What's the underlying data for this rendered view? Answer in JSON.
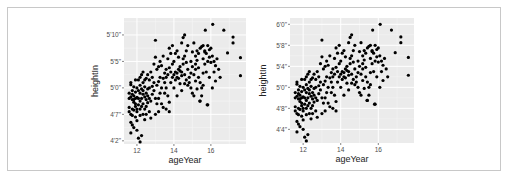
{
  "chart_data": [
    {
      "type": "scatter",
      "title": "",
      "xlabel": "ageYear",
      "ylabel": "heightIn",
      "xlim": [
        11.3,
        17.9
      ],
      "ylim": [
        49.4,
        73.2
      ],
      "x_ticks": [
        12,
        14,
        16
      ],
      "x_tick_labels": [
        "12",
        "14",
        "16"
      ],
      "y_ticks": [
        50,
        55,
        60,
        65,
        70
      ],
      "y_tick_labels": [
        "4'2\"",
        "4'7\"",
        "5'0\"",
        "5'5\"",
        "5'10\""
      ],
      "grid": true,
      "legend": "none",
      "panel_bg": "#ebebeb",
      "point_color": "#000000"
    },
    {
      "type": "scatter",
      "title": "",
      "xlabel": "ageYear",
      "ylabel": "heightIn",
      "xlim": [
        11.3,
        17.9
      ],
      "ylim": [
        49.4,
        73.2
      ],
      "x_ticks": [
        12,
        14,
        16
      ],
      "x_tick_labels": [
        "12",
        "14",
        "16"
      ],
      "y_ticks": [
        52,
        56,
        60,
        64,
        68,
        72
      ],
      "y_tick_labels": [
        "4'4\"",
        "4'8\"",
        "5'0\"",
        "5'4\"",
        "5'8\"",
        "6'0\""
      ],
      "grid": true,
      "legend": "none",
      "panel_bg": "#ebebeb",
      "point_color": "#000000"
    }
  ],
  "points": [
    [
      11.58,
      56.3
    ],
    [
      11.67,
      51.5
    ],
    [
      11.75,
      53.0
    ],
    [
      11.83,
      57.3
    ],
    [
      11.58,
      59.0
    ],
    [
      11.67,
      60.6
    ],
    [
      11.75,
      56.0
    ],
    [
      11.92,
      61.5
    ],
    [
      12.0,
      52.0
    ],
    [
      11.67,
      55.0
    ],
    [
      11.58,
      58.0
    ],
    [
      11.75,
      57.8
    ],
    [
      11.83,
      58.5
    ],
    [
      11.92,
      56.5
    ],
    [
      12.0,
      55.5
    ],
    [
      11.67,
      61.0
    ],
    [
      11.75,
      59.5
    ],
    [
      11.83,
      55.8
    ],
    [
      11.92,
      57.0
    ],
    [
      12.0,
      58.2
    ],
    [
      12.08,
      56.8
    ],
    [
      12.17,
      57.5
    ],
    [
      12.25,
      58.0
    ],
    [
      12.08,
      50.5
    ],
    [
      12.17,
      49.8
    ],
    [
      12.25,
      51.0
    ],
    [
      12.33,
      55.0
    ],
    [
      12.42,
      56.0
    ],
    [
      12.08,
      61.5
    ],
    [
      12.17,
      60.5
    ],
    [
      12.25,
      59.8
    ],
    [
      12.33,
      61.0
    ],
    [
      12.42,
      60.2
    ],
    [
      12.5,
      59.0
    ],
    [
      12.58,
      58.5
    ],
    [
      12.67,
      60.0
    ],
    [
      12.0,
      60.0
    ],
    [
      11.92,
      59.2
    ],
    [
      11.83,
      60.2
    ],
    [
      11.75,
      58.8
    ],
    [
      12.5,
      61.8
    ],
    [
      12.58,
      62.5
    ],
    [
      12.67,
      61.5
    ],
    [
      12.75,
      63.0
    ],
    [
      12.83,
      62.0
    ],
    [
      12.92,
      64.5
    ],
    [
      12.33,
      57.0
    ],
    [
      12.42,
      54.0
    ],
    [
      12.5,
      56.5
    ],
    [
      12.58,
      57.2
    ],
    [
      12.67,
      55.5
    ],
    [
      12.75,
      57.5
    ],
    [
      12.83,
      58.8
    ],
    [
      12.92,
      59.5
    ],
    [
      13.0,
      58.0
    ],
    [
      13.08,
      60.5
    ],
    [
      13.17,
      61.2
    ],
    [
      13.25,
      62.0
    ],
    [
      13.0,
      69.0
    ],
    [
      13.0,
      65.8
    ],
    [
      13.08,
      63.5
    ],
    [
      13.17,
      64.0
    ],
    [
      13.25,
      65.0
    ],
    [
      13.33,
      64.2
    ],
    [
      13.42,
      66.0
    ],
    [
      13.5,
      62.8
    ],
    [
      13.58,
      63.5
    ],
    [
      13.67,
      65.5
    ],
    [
      13.75,
      67.5
    ],
    [
      13.83,
      66.5
    ],
    [
      13.92,
      68.0
    ],
    [
      13.0,
      55.0
    ],
    [
      13.17,
      58.0
    ],
    [
      13.33,
      57.0
    ],
    [
      13.42,
      56.3
    ],
    [
      13.5,
      59.0
    ],
    [
      13.58,
      60.0
    ],
    [
      13.67,
      58.5
    ],
    [
      13.75,
      55.5
    ],
    [
      13.83,
      61.0
    ],
    [
      13.92,
      62.0
    ],
    [
      14.0,
      62.5
    ],
    [
      14.08,
      63.0
    ],
    [
      14.17,
      62.0
    ],
    [
      14.25,
      63.5
    ],
    [
      14.33,
      64.0
    ],
    [
      14.42,
      63.0
    ],
    [
      14.5,
      64.5
    ],
    [
      14.58,
      62.5
    ],
    [
      14.0,
      60.0
    ],
    [
      14.08,
      61.5
    ],
    [
      14.17,
      62.8
    ],
    [
      14.25,
      61.8
    ],
    [
      14.33,
      63.2
    ],
    [
      14.42,
      62.3
    ],
    [
      14.5,
      65.5
    ],
    [
      14.58,
      66.0
    ],
    [
      14.67,
      64.8
    ],
    [
      14.75,
      63.5
    ],
    [
      14.83,
      62.0
    ],
    [
      14.5,
      69.5
    ],
    [
      14.58,
      70.0
    ],
    [
      14.42,
      68.5
    ],
    [
      14.67,
      67.0
    ],
    [
      14.75,
      68.0
    ],
    [
      14.92,
      65.0
    ],
    [
      15.0,
      64.0
    ],
    [
      15.08,
      62.5
    ],
    [
      15.17,
      63.5
    ],
    [
      15.0,
      59.0
    ],
    [
      15.08,
      58.5
    ],
    [
      15.25,
      59.8
    ],
    [
      15.33,
      62.0
    ],
    [
      15.42,
      61.0
    ],
    [
      15.5,
      60.0
    ],
    [
      15.42,
      57.5
    ],
    [
      15.5,
      58.5
    ],
    [
      15.58,
      60.5
    ],
    [
      15.17,
      66.0
    ],
    [
      15.25,
      67.0
    ],
    [
      15.33,
      66.5
    ],
    [
      15.42,
      67.5
    ],
    [
      15.5,
      67.8
    ],
    [
      15.58,
      68.0
    ],
    [
      15.67,
      67.0
    ],
    [
      15.75,
      66.5
    ],
    [
      15.83,
      68.0
    ],
    [
      15.92,
      67.2
    ],
    [
      15.67,
      64.5
    ],
    [
      15.75,
      63.0
    ],
    [
      15.83,
      56.8
    ],
    [
      15.92,
      62.0
    ],
    [
      16.0,
      64.8
    ],
    [
      16.08,
      66.0
    ],
    [
      16.17,
      65.0
    ],
    [
      16.25,
      64.2
    ],
    [
      16.33,
      65.5
    ],
    [
      16.42,
      63.5
    ],
    [
      16.08,
      60.0
    ],
    [
      16.1,
      72.0
    ],
    [
      15.7,
      70.9
    ],
    [
      16.7,
      70.9
    ],
    [
      17.2,
      69.6
    ],
    [
      17.2,
      68.5
    ],
    [
      16.9,
      66.6
    ],
    [
      17.6,
      65.7
    ],
    [
      17.6,
      62.3
    ],
    [
      16.5,
      62.0
    ],
    [
      15.4,
      57.5
    ],
    [
      15.8,
      56.8
    ],
    [
      12.17,
      62.0
    ],
    [
      12.25,
      62.5
    ],
    [
      12.33,
      63.0
    ],
    [
      12.42,
      61.5
    ],
    [
      12.08,
      58.0
    ],
    [
      12.17,
      59.0
    ],
    [
      12.25,
      56.5
    ],
    [
      12.33,
      58.8
    ],
    [
      11.92,
      54.5
    ],
    [
      12.0,
      56.0
    ],
    [
      11.67,
      58.3
    ],
    [
      11.75,
      54.8
    ],
    [
      11.83,
      57.8
    ],
    [
      11.58,
      55.5
    ],
    [
      11.67,
      53.5
    ],
    [
      11.83,
      52.5
    ],
    [
      12.0,
      53.8
    ],
    [
      12.17,
      54.8
    ],
    [
      12.5,
      55.0
    ],
    [
      12.75,
      54.3
    ],
    [
      13.25,
      59.0
    ],
    [
      13.33,
      60.0
    ],
    [
      13.42,
      61.8
    ],
    [
      13.5,
      61.0
    ],
    [
      13.58,
      62.0
    ],
    [
      13.67,
      62.5
    ],
    [
      13.75,
      63.8
    ],
    [
      13.83,
      63.0
    ],
    [
      13.92,
      64.5
    ],
    [
      14.0,
      65.0
    ],
    [
      14.08,
      66.5
    ],
    [
      14.17,
      67.0
    ],
    [
      14.25,
      65.8
    ],
    [
      14.33,
      60.8
    ],
    [
      14.42,
      59.5
    ],
    [
      14.67,
      61.5
    ],
    [
      14.75,
      60.5
    ],
    [
      14.83,
      61.0
    ],
    [
      14.92,
      62.8
    ],
    [
      15.0,
      66.8
    ],
    [
      15.08,
      68.5
    ],
    [
      15.17,
      64.5
    ],
    [
      15.25,
      65.2
    ],
    [
      15.33,
      63.8
    ],
    [
      15.58,
      65.5
    ],
    [
      15.67,
      66.8
    ],
    [
      15.83,
      65.0
    ],
    [
      15.92,
      65.8
    ],
    [
      16.0,
      67.5
    ],
    [
      16.17,
      63.0
    ],
    [
      12.92,
      61.0
    ],
    [
      12.83,
      60.3
    ],
    [
      12.67,
      58.0
    ],
    [
      12.58,
      59.8
    ],
    [
      12.42,
      58.3
    ],
    [
      12.5,
      57.8
    ],
    [
      12.33,
      59.5
    ],
    [
      12.08,
      59.5
    ],
    [
      12.17,
      56.0
    ],
    [
      11.92,
      58.0
    ],
    [
      13.08,
      57.0
    ],
    [
      13.17,
      55.5
    ],
    [
      13.58,
      56.0
    ],
    [
      13.75,
      57.3
    ],
    [
      14.17,
      58.5
    ],
    [
      14.58,
      60.8
    ],
    [
      14.92,
      60.0
    ],
    [
      15.17,
      61.3
    ],
    [
      15.58,
      62.8
    ],
    [
      16.25,
      61.3
    ]
  ]
}
